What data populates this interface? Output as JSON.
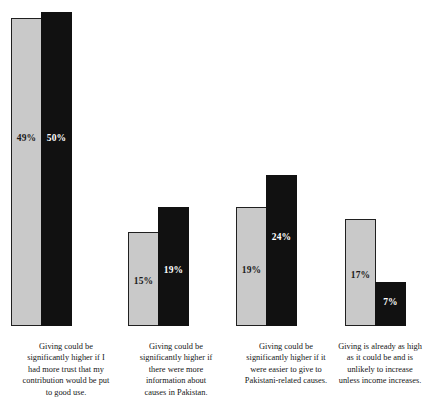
{
  "chart_data": {
    "type": "bar",
    "title": "",
    "subtitle": "",
    "xlabel": "",
    "ylabel": "",
    "ylim": [
      0,
      52
    ],
    "grid": false,
    "legend": "none",
    "orientation": "vertical",
    "value_label_format": "percent",
    "categories": [
      "Giving could be significantly higher if I had more trust that my contribution would be put to good use.",
      "Giving could be significantly higher if there were more information about causes in Pakistan.",
      "Giving could be significantly higher if it were easier to give to Pakistani-related causes.",
      "Giving is already as high as it could be and is unlikely to increase unless income increases."
    ],
    "series": [
      {
        "name": "series-a",
        "color": "#c9c9c9",
        "values": [
          49,
          15,
          19,
          17
        ],
        "labels": [
          "49%",
          "15%",
          "19%",
          "17%"
        ]
      },
      {
        "name": "series-b",
        "color": "#111111",
        "values": [
          50,
          19,
          24,
          7
        ],
        "labels": [
          "50%",
          "19%",
          "24%",
          "7%"
        ]
      }
    ],
    "groups": [
      {
        "label": "Giving could be significantly higher if I had more trust that my contribution would be put to good use.",
        "label_lines": [
          "Giving could be",
          "significantly higher if I",
          "had more trust that my",
          "contribution would be put",
          "to good use."
        ],
        "bar_a": {
          "value": 49,
          "label": "49%"
        },
        "bar_b": {
          "value": 50,
          "label": "50%"
        }
      },
      {
        "label": "Giving could be significantly higher if there were more information about causes in Pakistan.",
        "label_lines": [
          "Giving could be",
          "significantly higher if",
          "there were more",
          "information about",
          "causes in Pakistan."
        ],
        "bar_a": {
          "value": 15,
          "label": "15%"
        },
        "bar_b": {
          "value": 19,
          "label": "19%"
        }
      },
      {
        "label": "Giving could be significantly higher if it were easier to give to Pakistani-related causes.",
        "label_lines": [
          "Giving could be",
          "significantly higher if it",
          "were easier to give to",
          "Pakistani-related causes."
        ],
        "bar_a": {
          "value": 19,
          "label": "19%"
        },
        "bar_b": {
          "value": 24,
          "label": "24%"
        }
      },
      {
        "label": "Giving is already as high as it could be and is unlikely to increase unless income increases.",
        "label_lines": [
          "Giving is already as high",
          "as it could be and is",
          "unlikely to increase",
          "unless income increases."
        ],
        "bar_a": {
          "value": 17,
          "label": "17%"
        },
        "bar_b": {
          "value": 7,
          "label": "7%"
        }
      }
    ]
  },
  "layout": {
    "baseline_y": 325,
    "px_per_percent": 6.28,
    "group_x": [
      11,
      128,
      236,
      345
    ],
    "label_x": [
      2,
      120,
      230,
      330
    ],
    "label_width": [
      128,
      112,
      112,
      100
    ],
    "value_offset_a": [
      183,
      85,
      110,
      100
    ],
    "value_offset_b": [
      195,
      60,
      85,
      30
    ]
  }
}
